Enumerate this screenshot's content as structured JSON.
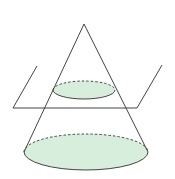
{
  "diagram": {
    "title": "",
    "colors": {
      "stroke": "#444444",
      "fill": "#d6eedb",
      "background": "#ffffff"
    },
    "shapes": {
      "cone": {
        "apex": [
          84,
          24
        ],
        "base_center": [
          86,
          152
        ],
        "base_rx": 62,
        "base_ry": 18
      },
      "cross_section": {
        "center": [
          84,
          90
        ],
        "rx": 31,
        "ry": 9
      },
      "plane": {
        "front_left": [
          13,
          108
        ],
        "front_right": [
          137,
          108
        ],
        "back_left": [
          37,
          66
        ],
        "back_right": [
          162,
          65
        ]
      }
    }
  }
}
